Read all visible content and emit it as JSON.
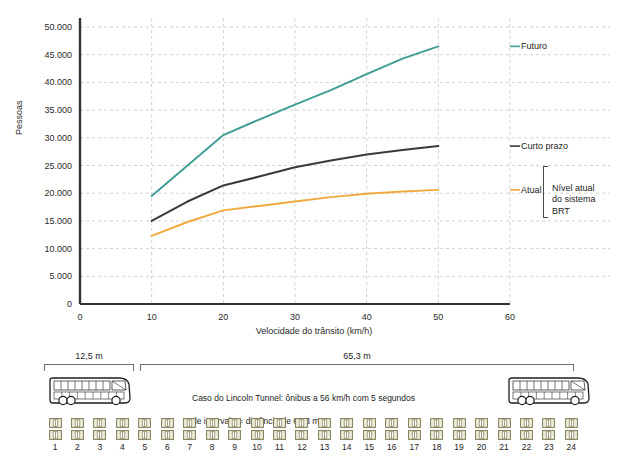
{
  "chart_data": {
    "type": "line",
    "title": "",
    "xlabel": "Velocidade do trânsito (km/h)",
    "ylabel": "Pessoas",
    "xlim": [
      0,
      60
    ],
    "ylim": [
      0,
      50000
    ],
    "xticks": [
      0,
      10,
      20,
      30,
      40,
      50,
      60
    ],
    "xtick_labels": [
      "0",
      "10",
      "20",
      "30",
      "40",
      "50",
      "60"
    ],
    "yticks": [
      0,
      5000,
      10000,
      15000,
      20000,
      25000,
      30000,
      35000,
      40000,
      45000,
      50000
    ],
    "ytick_labels": [
      "0",
      "5.000",
      "10.000",
      "15.000",
      "20.000",
      "25.000",
      "30.000",
      "35.000",
      "40.000",
      "45.000",
      "50.000"
    ],
    "grid": true,
    "legend_position": "right-inline-labels",
    "x": [
      10,
      15,
      20,
      25,
      30,
      35,
      40,
      45,
      50
    ],
    "series": [
      {
        "name": "Futuro",
        "color": "#3f9d95",
        "values": [
          19500,
          25000,
          30500,
          33300,
          36000,
          38600,
          41500,
          44300,
          46500
        ]
      },
      {
        "name": "Curto prazo",
        "color": "#3a3a3a",
        "values": [
          15000,
          18500,
          21400,
          23000,
          24700,
          25900,
          27000,
          27800,
          28500
        ]
      },
      {
        "name": "Atual",
        "color": "#efa93f",
        "values": [
          12300,
          14800,
          16900,
          17700,
          18500,
          19300,
          19900,
          20300,
          20600
        ]
      }
    ],
    "annotations": [
      {
        "text": "Futuro",
        "series": "Futuro"
      },
      {
        "text": "Curto prazo",
        "series": "Curto prazo"
      },
      {
        "text": "Atual",
        "series": "Atual"
      }
    ],
    "brace_note": "Nível atual\ndo sistema\nBRT",
    "brace_note_lines": [
      "Nível atual",
      "do sistema",
      "BRT"
    ]
  },
  "diagram": {
    "dim_left_label": "12,5 m",
    "dim_right_label": "65,3 m",
    "caption_line1": "Caso do Lincoln Tunnel: ônibus a 56 km/h com 5 segundos",
    "caption_line2": "de intervalo = distância de 65,3 m",
    "bus_icon_name": "bus-side-view-icon",
    "car_icon_name": "car-top-view-icon",
    "car_numbers": [
      "1",
      "2",
      "3",
      "4",
      "5",
      "6",
      "7",
      "8",
      "9",
      "10",
      "11",
      "12",
      "13",
      "14",
      "15",
      "16",
      "17",
      "18",
      "19",
      "20",
      "21",
      "22",
      "23",
      "24"
    ],
    "car_fill": "#efeedb",
    "car_stroke": "#7d7a52"
  },
  "colors": {
    "futuro": "#3f9d95",
    "curto_prazo": "#3a3a3a",
    "atual": "#efa93f",
    "axis": "#333333",
    "grid": "#bdbdbd"
  }
}
